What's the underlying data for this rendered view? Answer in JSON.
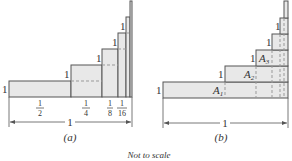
{
  "figure": {
    "caption": "Not to scale",
    "panels": [
      {
        "id": "a",
        "label": "(a)",
        "height_label": "1",
        "width_label": "1",
        "fraction_labels": [
          {
            "num": "1",
            "den": "2"
          },
          {
            "num": "1",
            "den": "4"
          },
          {
            "num": "1",
            "den": "8"
          },
          {
            "num": "1",
            "den": "16"
          }
        ]
      },
      {
        "id": "b",
        "label": "(b)",
        "height_label": "1",
        "width_label": "1",
        "area_labels": [
          {
            "base": "A",
            "sub": "1"
          },
          {
            "base": "A",
            "sub": "2"
          },
          {
            "base": "A",
            "sub": "3"
          }
        ]
      }
    ]
  },
  "colors": {
    "fill": "#e8e8e8",
    "stroke": "#555555",
    "dashed": "#999999"
  }
}
